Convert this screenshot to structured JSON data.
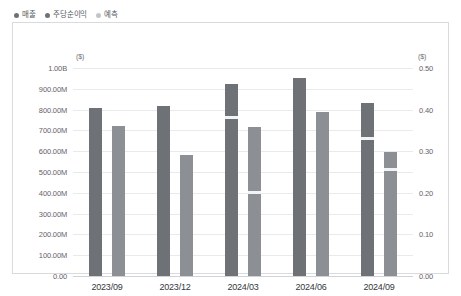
{
  "legend": {
    "items": [
      {
        "label": "매출",
        "color": "#6e7276",
        "icon": "legend-dot-revenue"
      },
      {
        "label": "주당순이익",
        "color": "#6e7276",
        "icon": "legend-dot-eps"
      },
      {
        "label": "예측",
        "color": "#c3c6c9",
        "icon": "legend-dot-forecast"
      }
    ]
  },
  "footer": {
    "note": ""
  },
  "chart_data": {
    "type": "bar",
    "title": "",
    "xlabel": "",
    "categories": [
      "2023/09",
      "2023/12",
      "2024/03",
      "2024/06",
      "2024/09"
    ],
    "grid": true,
    "legend_position": "top-left",
    "left_axis": {
      "unit": "($)",
      "label": "매출",
      "min": 0,
      "max": 1000000000,
      "ticks": [
        {
          "value": 1000000000,
          "label": "1.00B"
        },
        {
          "value": 900000000,
          "label": "900.00M"
        },
        {
          "value": 800000000,
          "label": "800.00M"
        },
        {
          "value": 700000000,
          "label": "700.00M"
        },
        {
          "value": 600000000,
          "label": "600.00M"
        },
        {
          "value": 500000000,
          "label": "500.00M"
        },
        {
          "value": 400000000,
          "label": "400.00M"
        },
        {
          "value": 300000000,
          "label": "300.00M"
        },
        {
          "value": 200000000,
          "label": "200.00M"
        },
        {
          "value": 100000000,
          "label": "100.00M"
        },
        {
          "value": 0,
          "label": "0.00"
        }
      ]
    },
    "right_axis": {
      "unit": "($)",
      "label": "주당순이익",
      "min": 0,
      "max": 0.5,
      "ticks": [
        {
          "value": 0.5,
          "label": "0.50"
        },
        {
          "value": 0.4,
          "label": "0.40"
        },
        {
          "value": 0.3,
          "label": "0.30"
        },
        {
          "value": 0.2,
          "label": "0.20"
        },
        {
          "value": 0.1,
          "label": "0.10"
        },
        {
          "value": 0.0,
          "label": "0.00"
        }
      ]
    },
    "series": [
      {
        "name": "매출",
        "axis": "left",
        "color": "#6e7276",
        "values": [
          810000000,
          815000000,
          925000000,
          950000000,
          830000000
        ]
      },
      {
        "name": "예측",
        "axis": "left",
        "color": "#8c9094",
        "values": [
          720000000,
          580000000,
          715000000,
          790000000,
          595000000
        ]
      },
      {
        "name": "주당순이익",
        "axis": "right",
        "color": "#f2f3f4",
        "values": [
          null,
          null,
          0.385,
          null,
          0.335
        ]
      },
      {
        "name": "주당순이익 예측",
        "axis": "right",
        "color": "#f2f3f4",
        "values": [
          null,
          null,
          0.205,
          null,
          0.26
        ]
      }
    ]
  }
}
